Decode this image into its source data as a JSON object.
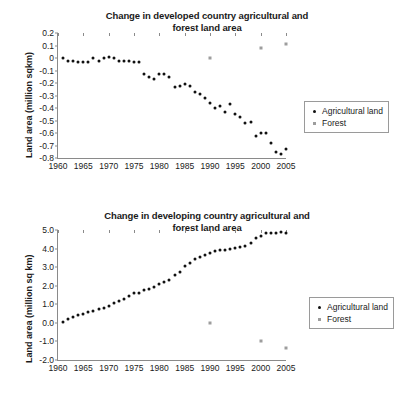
{
  "chart_data": [
    {
      "type": "scatter",
      "id": "developed",
      "title": "Change in developed country agricultural and forest land area",
      "title_line1": "Change in developed country agricultural and",
      "title_line2": "forest land area",
      "xlabel": "",
      "ylabel": "Land area (million sqkm)",
      "xlim": [
        1960,
        2005
      ],
      "ylim": [
        -0.8,
        0.2
      ],
      "xticks": [
        1960,
        1965,
        1970,
        1975,
        1980,
        1985,
        1990,
        1995,
        2000,
        2005
      ],
      "yticks": [
        0.2,
        0.1,
        0,
        -0.1,
        -0.2,
        -0.3,
        -0.4,
        -0.5,
        -0.6,
        -0.7,
        -0.8
      ],
      "ytick_labels": [
        "0.2",
        "0.1",
        "0",
        "-0.1",
        "-0.2",
        "-0.3",
        "-0.4",
        "-0.5",
        "-0.6",
        "-0.7",
        "-0.8"
      ],
      "grid": false,
      "legend_position": "right",
      "series": [
        {
          "name": "Agricultural land",
          "marker": "dot",
          "color": "#111111",
          "x": [
            1961,
            1962,
            1963,
            1964,
            1965,
            1966,
            1967,
            1968,
            1969,
            1970,
            1971,
            1972,
            1973,
            1974,
            1975,
            1976,
            1977,
            1978,
            1979,
            1980,
            1981,
            1982,
            1983,
            1984,
            1985,
            1986,
            1987,
            1988,
            1989,
            1990,
            1991,
            1992,
            1993,
            1994,
            1995,
            1996,
            1997,
            1998,
            1999,
            2000,
            2001,
            2002,
            2003,
            2004,
            2005
          ],
          "values": [
            0.0,
            -0.02,
            -0.02,
            -0.03,
            -0.03,
            -0.03,
            0.0,
            -0.02,
            0.0,
            0.01,
            0.0,
            -0.02,
            -0.02,
            -0.02,
            -0.03,
            -0.03,
            -0.13,
            -0.15,
            -0.17,
            -0.13,
            -0.13,
            -0.15,
            -0.23,
            -0.22,
            -0.21,
            -0.22,
            -0.27,
            -0.29,
            -0.32,
            -0.36,
            -0.4,
            -0.38,
            -0.43,
            -0.37,
            -0.45,
            -0.47,
            -0.52,
            -0.51,
            -0.62,
            -0.6,
            -0.6,
            -0.68,
            -0.75,
            -0.77,
            -0.73
          ]
        },
        {
          "name": "Forest",
          "marker": "square",
          "color": "#9d9d9d",
          "x": [
            1990,
            2000,
            2005
          ],
          "values": [
            0.0,
            0.08,
            0.11
          ]
        }
      ]
    },
    {
      "type": "scatter",
      "id": "developing",
      "title": "Change in developing country agricultural and forest land area",
      "title_line1": "Change in developing country agricultural and",
      "title_line2": "forest land area",
      "xlabel": "",
      "ylabel": "Land area (million sq km)",
      "xlim": [
        1960,
        2005
      ],
      "ylim": [
        -2.0,
        5.0
      ],
      "xticks": [
        1960,
        1965,
        1970,
        1975,
        1980,
        1985,
        1990,
        1995,
        2000,
        2005
      ],
      "yticks": [
        5.0,
        4.0,
        3.0,
        2.0,
        1.0,
        0.0,
        -1.0,
        -2.0
      ],
      "ytick_labels": [
        "5.0",
        "4.0",
        "3.0",
        "2.0",
        "1.0",
        "0.0",
        "-1.0",
        "-2.0"
      ],
      "grid": false,
      "legend_position": "right",
      "series": [
        {
          "name": "Agricultural land",
          "marker": "dot",
          "color": "#111111",
          "x": [
            1961,
            1962,
            1963,
            1964,
            1965,
            1966,
            1967,
            1968,
            1969,
            1970,
            1971,
            1972,
            1973,
            1974,
            1975,
            1976,
            1977,
            1978,
            1979,
            1980,
            1981,
            1982,
            1983,
            1984,
            1985,
            1986,
            1987,
            1988,
            1989,
            1990,
            1991,
            1992,
            1993,
            1994,
            1995,
            1996,
            1997,
            1998,
            1999,
            2000,
            2001,
            2002,
            2003,
            2004,
            2005
          ],
          "values": [
            0.05,
            0.2,
            0.3,
            0.4,
            0.5,
            0.58,
            0.65,
            0.72,
            0.8,
            0.9,
            1.05,
            1.2,
            1.3,
            1.45,
            1.6,
            1.62,
            1.75,
            1.85,
            1.95,
            2.1,
            2.2,
            2.3,
            2.6,
            2.75,
            3.05,
            3.25,
            3.45,
            3.55,
            3.65,
            3.78,
            3.85,
            3.9,
            3.95,
            4.0,
            4.05,
            4.1,
            4.15,
            4.3,
            4.55,
            4.7,
            4.85,
            4.85,
            4.85,
            4.88,
            4.85
          ]
        },
        {
          "name": "Forest",
          "marker": "square",
          "color": "#9d9d9d",
          "x": [
            1990,
            2000,
            2005
          ],
          "values": [
            0.0,
            -1.0,
            -1.35
          ]
        }
      ]
    }
  ],
  "panels": [
    {
      "legend": {
        "items": [
          {
            "label": "Agricultural land",
            "marker": "dot"
          },
          {
            "label": "Forest",
            "marker": "square"
          }
        ]
      }
    },
    {
      "legend": {
        "items": [
          {
            "label": "Agricultural land",
            "marker": "dot"
          },
          {
            "label": "Forest",
            "marker": "square"
          }
        ]
      }
    }
  ],
  "colors": {
    "agricultural": "#111111",
    "forest": "#9d9d9d",
    "axis": "#8a8a8a",
    "text": "#1a1a1a",
    "background": "#ffffff"
  }
}
